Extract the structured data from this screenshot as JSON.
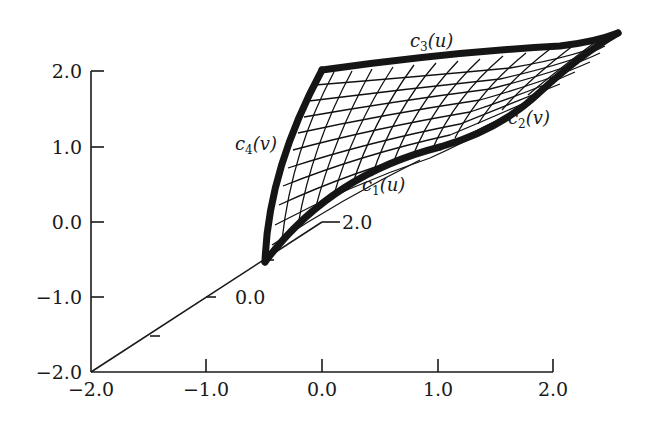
{
  "figure": {
    "type": "coons-patch-surface-3d"
  },
  "axes": {
    "vertical": {
      "ticks": [
        "2.0",
        "1.0",
        "0.0",
        "−1.0",
        "−2.0"
      ]
    },
    "horizontal": {
      "ticks": [
        "−2.0",
        "−1.0",
        "0.0",
        "1.0",
        "2.0"
      ]
    },
    "depth": {
      "ticks": [
        "0.0",
        "2.0"
      ]
    }
  },
  "curves": {
    "c1": {
      "name": "c",
      "sub": "1",
      "arg": "(u)"
    },
    "c2": {
      "name": "c",
      "sub": "2",
      "arg": "(v)"
    },
    "c3": {
      "name": "c",
      "sub": "3",
      "arg": "(u)"
    },
    "c4": {
      "name": "c",
      "sub": "4",
      "arg": "(v)"
    }
  },
  "colors": {
    "ink": "#151515",
    "background": "#ffffff"
  }
}
